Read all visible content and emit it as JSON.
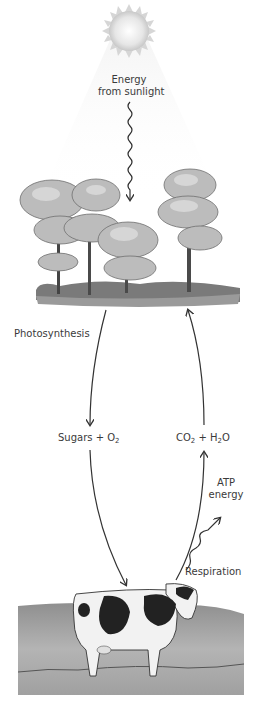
{
  "diagram": {
    "labels": {
      "energy_line1": "Energy",
      "energy_line2": "from sunlight",
      "photosynthesis": "Photosynthesis",
      "sugars_text": "Sugars + O",
      "sugars_sub": "2",
      "co2_text": "CO",
      "co2_sub": "2",
      "co2_plus": " + H",
      "h2o_sub": "2",
      "h2o_end": "O",
      "atp_line1": "ATP",
      "atp_line2": "energy",
      "respiration": "Respiration"
    },
    "nodes": [
      {
        "id": "sun",
        "icon": "sun-icon"
      },
      {
        "id": "trees",
        "icon": "trees-illustration"
      },
      {
        "id": "cow",
        "icon": "cow-illustration"
      }
    ],
    "edges": [
      {
        "from": "sun",
        "to": "trees",
        "label": "Energy from sunlight",
        "style": "wavy"
      },
      {
        "from": "trees",
        "to": "Sugars + O2",
        "label": "Photosynthesis"
      },
      {
        "from": "Sugars + O2",
        "to": "cow"
      },
      {
        "from": "cow",
        "to": "CO2 + H2O",
        "label": "Respiration"
      },
      {
        "from": "CO2 + H2O",
        "to": "trees"
      },
      {
        "from": "cow",
        "to": "ATP energy",
        "style": "wavy"
      }
    ],
    "colors": {
      "arrow": "#333333",
      "text": "#3a3a3a",
      "sun": "#d9d9d9",
      "ground": "#8a8a8a"
    }
  }
}
